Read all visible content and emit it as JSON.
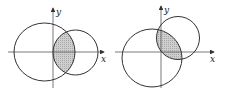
{
  "figures": [
    {
      "id": "left",
      "x_axis_label": "x",
      "y_axis_label": "y",
      "origin": [
        53,
        52
      ],
      "large_circle": {
        "cx": 44.5,
        "cy": 52,
        "rx": 30.5,
        "ry": 29
      },
      "small_circle": {
        "cx": 75.5,
        "cy": 52.5,
        "r": 22.5
      },
      "shaded": "intersection of the two circles"
    },
    {
      "id": "right",
      "x_axis_label": "x",
      "y_axis_label": "y",
      "origin": [
        161,
        52
      ],
      "large_circle": {
        "cx": 152,
        "cy": 58,
        "rx": 30,
        "ry": 29
      },
      "small_circle": {
        "cx": 178,
        "cy": 38,
        "r": 21.5
      },
      "shaded": "intersection of the two circles"
    }
  ],
  "colors": {
    "stroke": "#333333",
    "shade": "#c8c8c8",
    "background": "#ffffff"
  }
}
